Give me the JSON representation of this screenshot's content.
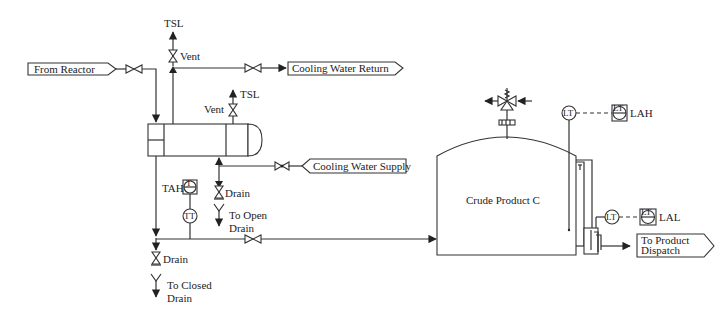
{
  "diagram": {
    "type": "process-flow-diagram",
    "streams": {
      "from_reactor": "From Reactor",
      "cooling_water_return": "Cooling Water Return",
      "cooling_water_supply": "Cooling Water Supply",
      "to_product_dispatch_line1": "To Product",
      "to_product_dispatch_line2": "Dispatch"
    },
    "tank": {
      "label": "Crude Product C"
    },
    "labels": {
      "tsl_top": "TSL",
      "vent_top": "Vent",
      "tsl_shell": "TSL",
      "vent_shell": "Vent",
      "tah": "TAH",
      "drain_shell": "Drain",
      "to_open_drain_line1": "To Open",
      "to_open_drain_line2": "Drain",
      "drain_bottom": "Drain",
      "to_closed_drain_line1": "To Closed",
      "to_closed_drain_line2": "Drain",
      "lah": "LAH",
      "lal": "LAL"
    },
    "instruments": {
      "tt": "TT",
      "lt_top": "LT",
      "lt_side": "LT",
      "lah_inner": "LT",
      "lal_inner": "LT",
      "tah_inner": "T"
    }
  }
}
